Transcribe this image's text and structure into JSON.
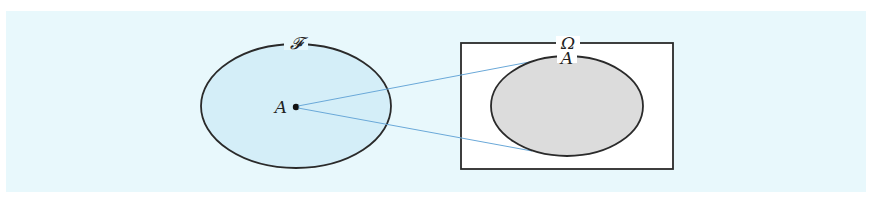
{
  "figure": {
    "background_color": "#e8f8fc",
    "left_set": {
      "label": "𝓕",
      "fill_color": "#d4eef8",
      "stroke_color": "#2a2a2a",
      "point": {
        "label": "A"
      }
    },
    "right_set": {
      "universe_label": "Ω",
      "universe_fill": "#ffffff",
      "subset_label": "A",
      "subset_fill": "#dcdcdc",
      "stroke_color": "#2a2a2a"
    },
    "connector_color": "#6aa8d8"
  }
}
